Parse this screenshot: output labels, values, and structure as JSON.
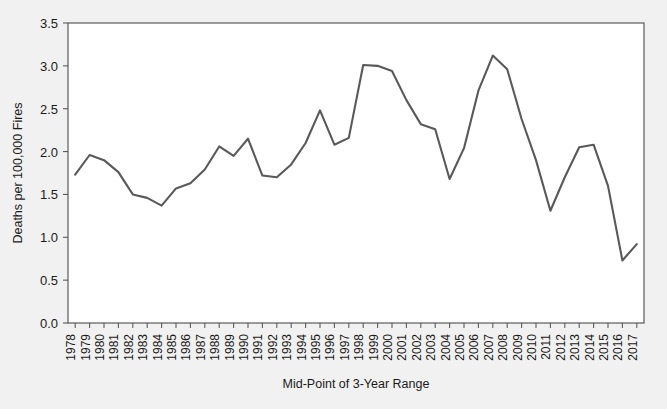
{
  "chart_data": {
    "type": "line",
    "title": "",
    "xlabel": "Mid-Point of 3-Year Range",
    "ylabel": "Deaths per 100,000 Fires",
    "grid": false,
    "legend": null,
    "legend_position": "none",
    "line_color": "#595959",
    "plot_background": "#ffffff",
    "figure_background": "#f1f1f1",
    "xlim": [
      1977.5,
      2017.5
    ],
    "ylim": [
      0.0,
      3.5
    ],
    "ytick_labels": [
      "0.0",
      "0.5",
      "1.0",
      "1.5",
      "2.0",
      "2.5",
      "3.0",
      "3.5"
    ],
    "ytick_values": [
      0.0,
      0.5,
      1.0,
      1.5,
      2.0,
      2.5,
      3.0,
      3.5
    ],
    "categories": [
      "1978",
      "1979",
      "1980",
      "1981",
      "1982",
      "1983",
      "1984",
      "1985",
      "1986",
      "1987",
      "1988",
      "1989",
      "1990",
      "1991",
      "1992",
      "1993",
      "1994",
      "1995",
      "1996",
      "1997",
      "1998",
      "1999",
      "2000",
      "2001",
      "2002",
      "2003",
      "2004",
      "2005",
      "2006",
      "2007",
      "2008",
      "2009",
      "2010",
      "2011",
      "2012",
      "2013",
      "2014",
      "2015",
      "2016",
      "2017"
    ],
    "values": [
      1.73,
      1.96,
      1.9,
      1.76,
      1.5,
      1.46,
      1.37,
      1.57,
      1.63,
      1.79,
      2.06,
      1.95,
      2.15,
      1.72,
      1.7,
      1.85,
      2.1,
      2.48,
      2.08,
      2.16,
      3.01,
      3.0,
      2.94,
      2.6,
      2.32,
      2.26,
      1.68,
      2.04,
      2.71,
      3.12,
      2.96,
      2.38,
      1.9,
      1.31,
      1.7,
      2.05,
      2.08,
      1.6,
      0.73,
      0.92
    ]
  }
}
